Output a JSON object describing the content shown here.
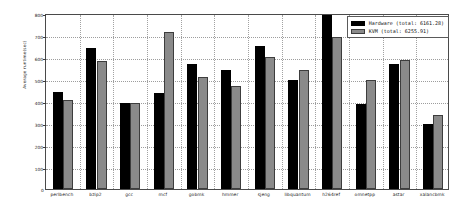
{
  "chart_data": {
    "type": "bar",
    "title": "",
    "xlabel": "",
    "ylabel": "Average runtime(sec)",
    "ylim": [
      0,
      800
    ],
    "yticks": [
      0,
      100,
      200,
      300,
      400,
      500,
      600,
      700,
      800
    ],
    "ytick_labels": [
      "0",
      "100",
      "200",
      "300",
      "400",
      "500",
      "600",
      "700",
      "800"
    ],
    "grid": true,
    "legend_position": "upper right",
    "categories": [
      "perlbench",
      "bzip2",
      "gcc",
      "mcf",
      "gobmk",
      "hmmer",
      "sjeng",
      "libquantum",
      "h264ref",
      "omnetpp",
      "astar",
      "xalancbmk"
    ],
    "series": [
      {
        "name": "Hardware",
        "legend_label": "Hardware (total: 6161.28)",
        "total": 6161.28,
        "color": "#000000",
        "values": [
          440,
          640,
          390,
          435,
          570,
          540,
          650,
          495,
          790,
          385,
          570,
          295
        ]
      },
      {
        "name": "KVM",
        "legend_label": "KVM (total: 6255.91)",
        "total": 6255.91,
        "color": "#8a8a8a",
        "values": [
          405,
          580,
          390,
          715,
          510,
          470,
          598,
          540,
          690,
          495,
          585,
          335
        ]
      }
    ]
  },
  "legend": {
    "hardware_label": "Hardware (total: 6161.28)",
    "kvm_label": "KVM (total: 6255.91)"
  },
  "axes": {
    "y_title": "Average runtime(sec)",
    "origin_label": "0"
  }
}
